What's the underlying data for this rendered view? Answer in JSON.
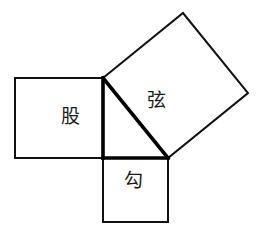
{
  "figure": {
    "background_color": "#ffffff",
    "stroke_color": "#111111",
    "emphasis_stroke_color": "#000000",
    "width": 267,
    "height": 238
  },
  "labels": {
    "leg_vertical": "股",
    "hypotenuse": "弦",
    "leg_horizontal": "勾"
  },
  "chart_data": {
    "type": "diagram",
    "shapes": [
      {
        "name": "square-on-vertical-leg",
        "label": "股",
        "points": [
          [
            15,
            78
          ],
          [
            103,
            78
          ],
          [
            103,
            158
          ],
          [
            15,
            158
          ]
        ],
        "stroke_width": 2
      },
      {
        "name": "square-on-horizontal-leg",
        "label": "勾",
        "points": [
          [
            103,
            158
          ],
          [
            168,
            158
          ],
          [
            168,
            222
          ],
          [
            103,
            222
          ]
        ],
        "stroke_width": 2
      },
      {
        "name": "square-on-hypotenuse",
        "label": "弦",
        "points": [
          [
            103,
            78
          ],
          [
            183,
            13
          ],
          [
            248,
            93
          ],
          [
            168,
            158
          ]
        ],
        "stroke_width": 2
      }
    ],
    "triangle": {
      "name": "right-triangle",
      "vertices": {
        "right_angle": [
          103,
          158
        ],
        "apex": [
          103,
          78
        ],
        "right": [
          168,
          158
        ]
      },
      "edges": [
        {
          "name": "vertical-leg",
          "from": [
            103,
            78
          ],
          "to": [
            103,
            158
          ],
          "length": 80,
          "label": "股",
          "stroke_width": 3.6
        },
        {
          "name": "horizontal-leg",
          "from": [
            103,
            158
          ],
          "to": [
            168,
            158
          ],
          "length": 65,
          "label": "勾",
          "stroke_width": 3.6
        },
        {
          "name": "hypotenuse",
          "from": [
            103,
            78
          ],
          "to": [
            168,
            158
          ],
          "length": 103,
          "label": "弦",
          "stroke_width": 3.6
        }
      ]
    },
    "grid": false,
    "legend": null
  }
}
